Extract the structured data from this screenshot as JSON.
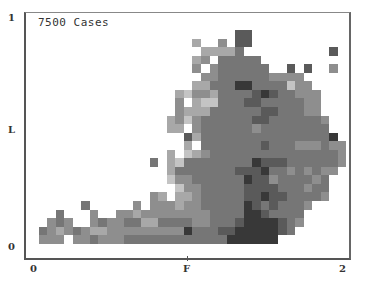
{
  "chart": {
    "title": "7500 Cases",
    "y_ticks": [
      {
        "label": "1",
        "top": 12
      },
      {
        "label": "L",
        "top": 124
      },
      {
        "label": "0",
        "top": 241
      }
    ],
    "x_ticks": [
      {
        "label": "0",
        "left": 30
      },
      {
        "label": "F",
        "left": 183
      },
      {
        "label": "2",
        "left": 339
      }
    ]
  },
  "chart_data": {
    "type": "heatmap",
    "title": "7500 Cases",
    "xlabel": "",
    "ylabel": "",
    "x_tick_labels": [
      "0",
      "F",
      "2"
    ],
    "y_tick_labels": [
      "0",
      "L",
      "1"
    ],
    "grid": {
      "origin_x": 30,
      "origin_y": 30,
      "cell": 8.55,
      "cols": 37,
      "rows": 25
    },
    "value_scale": "0 = empty, 1 = lightest gray ... 6 = darkest",
    "palette": {
      "1": "#c4c4c4",
      "2": "#a8a8a8",
      "3": "#8e8e8e",
      "4": "#767676",
      "5": "#5a5a5a",
      "6": "#383838"
    },
    "rows": [
      "0000000000000000000000005500000000000",
      "0000000000000000000200305500000000000",
      "0000000000000000000022224000000000050",
      "0000000000000000000230444440000000000",
      "0000000000000000000303444444005050030",
      "0000000000000000000033444444333300000",
      "0000000000000000000224446644441330000",
      "0000000000000000021332444456544333000",
      "0000000000000000030211444554444433000",
      "0000000000000000032224444445544433000",
      "0000000000000000231344444455444444300",
      "0000000000000000220344444434444444400",
      "0000000000000000005244444444444444460",
      "0000000000000000002044444445444333433",
      "0000000000000000201234444444444444443",
      "0000000000000040214444444465554444443",
      "0000000000000000244444445556443434330",
      "0000000000000000133444444655344443400",
      "0000000000000000013344444555544434400",
      "0000000000000032022344444556554444300",
      "0000004000003033323344444654544430000",
      "0004000300332333333334444665444400000",
      "0034300343344224444334445666654300000",
      "0432343223333333336444556666654000000",
      "0333033433344444444444466666600000000"
    ]
  }
}
